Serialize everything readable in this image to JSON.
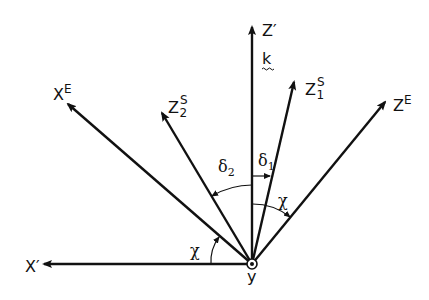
{
  "diagram": {
    "title": "",
    "colors": {
      "stroke": "#111111",
      "background": "#ffffff"
    },
    "origin": {
      "label": "y",
      "marker": "dot-in-circle (out of page)"
    },
    "axes": [
      {
        "id": "x-prime",
        "label": "X",
        "sup": "′",
        "sub": ""
      },
      {
        "id": "x-E",
        "label": "X",
        "sup": "E",
        "sub": ""
      },
      {
        "id": "z2-S",
        "label": "Z",
        "sup": "S",
        "sub": "2"
      },
      {
        "id": "z-prime",
        "label": "Z",
        "sup": "′",
        "sub": ""
      },
      {
        "id": "z1-S",
        "label": "Z",
        "sup": "S",
        "sub": "1"
      },
      {
        "id": "z-E",
        "label": "Z",
        "sup": "E",
        "sub": ""
      }
    ],
    "vector_label": "k",
    "angles": [
      {
        "id": "delta2",
        "symbol": "δ",
        "sub": "2",
        "between": "z′ → z₂ˢ"
      },
      {
        "id": "delta1",
        "symbol": "δ",
        "sub": "1",
        "between": "z′ → z₁ˢ"
      },
      {
        "id": "chi-right",
        "symbol": "χ",
        "sub": "",
        "between": "z′ → zᴱ"
      },
      {
        "id": "chi-left",
        "symbol": "χ",
        "sub": "",
        "between": "x′ → xᴱ"
      }
    ]
  }
}
